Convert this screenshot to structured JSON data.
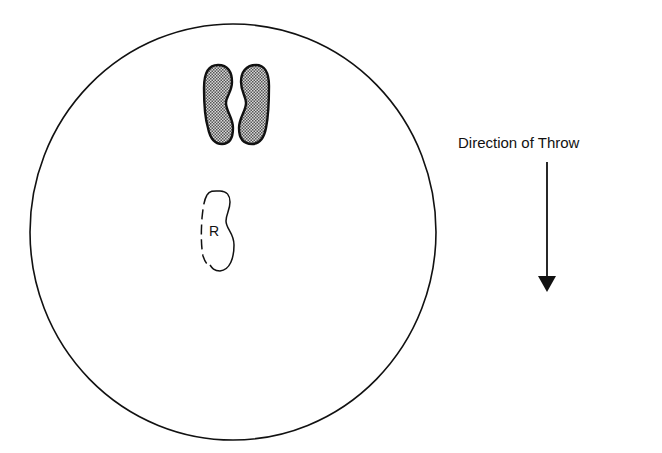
{
  "diagram": {
    "circle_label": "throwing-circle",
    "footprint_right_label": "R",
    "direction_label": "Direction of Throw",
    "colors": {
      "stroke": "#111111",
      "shade_dot": "#555555",
      "background": "#ffffff"
    }
  }
}
